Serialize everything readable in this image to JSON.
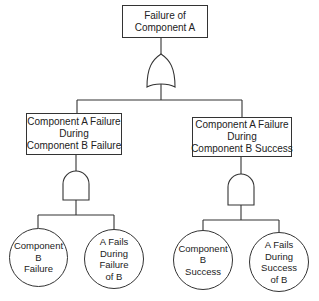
{
  "diagram": {
    "type": "fault-tree",
    "top_event": {
      "lines": [
        "Failure of",
        "Component A"
      ]
    },
    "top_gate": {
      "type": "OR"
    },
    "intermediate_events": [
      {
        "lines": [
          "Component A Failure",
          "During",
          "Component B Failure"
        ],
        "gate": {
          "type": "AND"
        },
        "basic_events": [
          {
            "lines": [
              "Component",
              "B",
              "Failure"
            ]
          },
          {
            "lines": [
              "A Fails",
              "During",
              "Failure",
              "of B"
            ]
          }
        ]
      },
      {
        "lines": [
          "Component A Failure",
          "During",
          "Component B Success"
        ],
        "gate": {
          "type": "AND"
        },
        "basic_events": [
          {
            "lines": [
              "Component",
              "B",
              "Success"
            ]
          },
          {
            "lines": [
              "A Fails",
              "During",
              "Success",
              "of B"
            ]
          }
        ]
      }
    ]
  },
  "colors": {
    "line": "#333333",
    "background": "#ffffff"
  }
}
